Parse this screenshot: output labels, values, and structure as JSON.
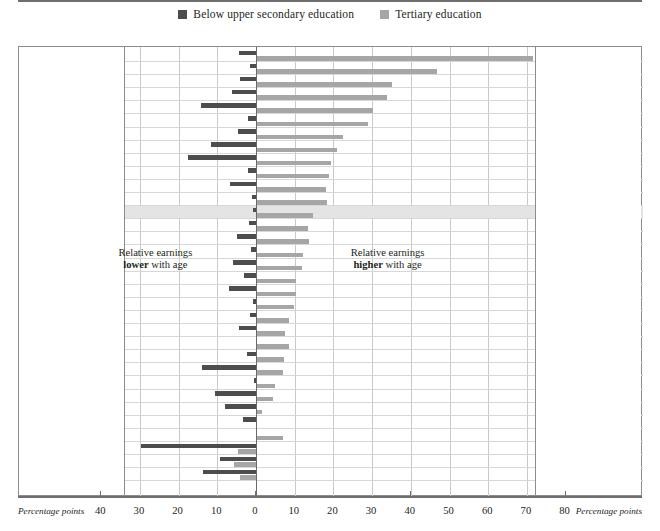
{
  "legend": {
    "items": [
      {
        "label": "Below upper secondary education",
        "color": "#4d4d4d",
        "icon": "square-swatch-dark"
      },
      {
        "label": "Tertiary education",
        "color": "#a6a6a6",
        "icon": "square-swatch-light"
      }
    ]
  },
  "annotations": {
    "left_line1": "Relative earnings",
    "left_line2_bold": "lower",
    "left_line2_rest": " with age",
    "right_line1": "Relative earnings",
    "right_line2_bold": "higher",
    "right_line2_rest": " with age"
  },
  "axis": {
    "left_caption": "Percentage points",
    "right_caption": "Percentage points",
    "left_ticks": [
      "40",
      "30",
      "20",
      "10"
    ],
    "center_tick": "0",
    "right_ticks": [
      "10",
      "20",
      "30",
      "40",
      "50",
      "60",
      "70",
      "80"
    ]
  },
  "chart_data": {
    "type": "bar",
    "orientation": "horizontal",
    "title": "",
    "xlabel": "Percentage points",
    "ylabel": "",
    "xlim": [
      -40,
      80
    ],
    "grid": true,
    "legend_position": "top-center",
    "series": [
      {
        "name": "Below upper secondary education",
        "color": "#4d4d4d"
      },
      {
        "name": "Tertiary education",
        "color": "#a6a6a6"
      }
    ],
    "categories": [
      "Korea",
      "Italy¹",
      "Poland",
      "Slovenia",
      "France¹",
      "Japan²",
      "Norway³",
      "Canada³",
      "Portugal³",
      "Finland³",
      "Spain³",
      "Luxembourg",
      "OECD average",
      "Czech Republic",
      "Sweden",
      "Hungary",
      "Slovak Republic",
      "Switzerland",
      "Israel",
      "Austria",
      "Denmark",
      "Belgium",
      "United States",
      "Australia³",
      "Brazil²",
      "New Zealand",
      "Estonia",
      "Netherlands¹",
      "Germany",
      "United Kingdom",
      "Greece³",
      "Turkey⁴",
      "Ireland"
    ],
    "rows": [
      {
        "country": "Korea",
        "sup": "",
        "below_upper_secondary": -4.3,
        "tertiary": 71.5
      },
      {
        "country": "Italy",
        "sup": "1",
        "below_upper_secondary": -1.6,
        "tertiary": 46.8
      },
      {
        "country": "Poland",
        "sup": "",
        "below_upper_secondary": -4.2,
        "tertiary": 35.2
      },
      {
        "country": "Slovenia",
        "sup": "",
        "below_upper_secondary": -6.1,
        "tertiary": 33.8
      },
      {
        "country": "France",
        "sup": "1",
        "below_upper_secondary": -14.2,
        "tertiary": 30.2
      },
      {
        "country": "Japan",
        "sup": "2",
        "below_upper_secondary": -2.0,
        "tertiary": 29.0
      },
      {
        "country": "Norway",
        "sup": "3",
        "below_upper_secondary": -4.6,
        "tertiary": 22.5
      },
      {
        "country": "Canada",
        "sup": "3",
        "below_upper_secondary": -11.6,
        "tertiary": 21.0
      },
      {
        "country": "Portugal",
        "sup": "3",
        "below_upper_secondary": -17.6,
        "tertiary": 19.4
      },
      {
        "country": "Finland",
        "sup": "3",
        "below_upper_secondary": -2.1,
        "tertiary": 18.8
      },
      {
        "country": "Spain",
        "sup": "3",
        "below_upper_secondary": -6.6,
        "tertiary": 18.0
      },
      {
        "country": "Luxembourg",
        "sup": "",
        "below_upper_secondary": -1.0,
        "tertiary": 18.4
      },
      {
        "country": "OECD average",
        "sup": "",
        "below_upper_secondary": -0.8,
        "tertiary": 14.8
      },
      {
        "country": "Czech Republic",
        "sup": "",
        "below_upper_secondary": -1.8,
        "tertiary": 13.4
      },
      {
        "country": "Sweden",
        "sup": "",
        "below_upper_secondary": -4.8,
        "tertiary": 13.7
      },
      {
        "country": "Hungary",
        "sup": "",
        "below_upper_secondary": -1.3,
        "tertiary": 12.1
      },
      {
        "country": "Slovak Republic",
        "sup": "",
        "below_upper_secondary": -6.0,
        "tertiary": 12.0
      },
      {
        "country": "Switzerland",
        "sup": "",
        "below_upper_secondary": -3.0,
        "tertiary": 10.3
      },
      {
        "country": "Israel",
        "sup": "",
        "below_upper_secondary": -7.0,
        "tertiary": 10.3
      },
      {
        "country": "Austria",
        "sup": "",
        "below_upper_secondary": -0.8,
        "tertiary": 9.8
      },
      {
        "country": "Denmark",
        "sup": "",
        "below_upper_secondary": -1.5,
        "tertiary": 8.6
      },
      {
        "country": "Belgium",
        "sup": "",
        "below_upper_secondary": -4.5,
        "tertiary": 7.6
      },
      {
        "country": "United States",
        "sup": "",
        "below_upper_secondary": 0.0,
        "tertiary": 8.4
      },
      {
        "country": "Australia",
        "sup": "3",
        "below_upper_secondary": -2.2,
        "tertiary": 7.2
      },
      {
        "country": "Brazil",
        "sup": "2",
        "below_upper_secondary": -14.0,
        "tertiary": 7.0
      },
      {
        "country": "New Zealand",
        "sup": "",
        "below_upper_secondary": -0.6,
        "tertiary": 5.0
      },
      {
        "country": "Estonia",
        "sup": "",
        "below_upper_secondary": -10.6,
        "tertiary": 4.4
      },
      {
        "country": "Netherlands",
        "sup": "1",
        "below_upper_secondary": -8.0,
        "tertiary": 1.6
      },
      {
        "country": "Germany",
        "sup": "",
        "below_upper_secondary": -3.4,
        "tertiary": 0.0
      },
      {
        "country": "United Kingdom",
        "sup": "",
        "below_upper_secondary": 0.0,
        "tertiary": 7.0
      },
      {
        "country": "Greece",
        "sup": "3",
        "below_upper_secondary": -29.6,
        "tertiary": -4.6
      },
      {
        "country": "Turkey",
        "sup": "4",
        "below_upper_secondary": -9.3,
        "tertiary": -5.6
      },
      {
        "country": "Ireland",
        "sup": "",
        "below_upper_secondary": -13.7,
        "tertiary": -4.2
      }
    ]
  }
}
